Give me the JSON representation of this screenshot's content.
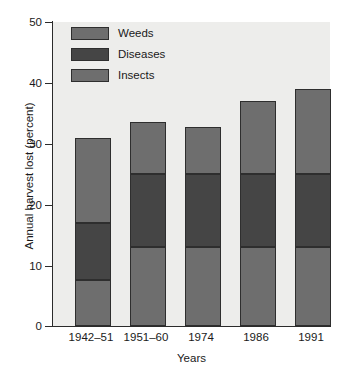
{
  "chart_data": {
    "type": "bar",
    "subtype": "stacked-bar",
    "title": "",
    "xlabel": "Years",
    "ylabel": "Annual harvest lost (percent)",
    "categories": [
      "1942–51",
      "1951–60",
      "1974",
      "1986",
      "1991"
    ],
    "series": [
      {
        "name": "Insects",
        "color": "#6e6e6e",
        "values": [
          7.5,
          13,
          13,
          13,
          13
        ]
      },
      {
        "name": "Diseases",
        "color": "#454545",
        "values": [
          9.5,
          12,
          12,
          12,
          12
        ]
      },
      {
        "name": "Weeds",
        "color": "#6e6e6e",
        "values": [
          14,
          8.5,
          7.7,
          12,
          14
        ]
      }
    ],
    "stack_order_bottom_to_top": [
      "Insects",
      "Diseases",
      "Weeds"
    ],
    "cumulative_tops": {
      "1942–51": [
        7.5,
        17.0,
        31.0
      ],
      "1951–60": [
        13.0,
        25.0,
        33.5
      ],
      "1974": [
        13.0,
        25.0,
        32.7
      ],
      "1986": [
        13.0,
        25.0,
        37.0
      ],
      "1991": [
        13.0,
        25.0,
        39.0
      ]
    },
    "totals": [
      31.0,
      33.5,
      32.7,
      37.0,
      39.0
    ],
    "ylim": [
      0,
      50
    ],
    "yticks": [
      0,
      10,
      20,
      30,
      40,
      50
    ],
    "ytick_labels": [
      "0",
      "10",
      "20",
      "30",
      "40",
      "50"
    ],
    "grid": false,
    "legend_position": "top-left-inside",
    "legend_entries": [
      {
        "label": "Weeds",
        "color": "#6e6e6e"
      },
      {
        "label": "Diseases",
        "color": "#454545"
      },
      {
        "label": "Insects",
        "color": "#6e6e6e"
      }
    ],
    "plot_background": "#ededeb",
    "figure_background": "#ffffff",
    "axis_color": "#2b2b2b"
  }
}
